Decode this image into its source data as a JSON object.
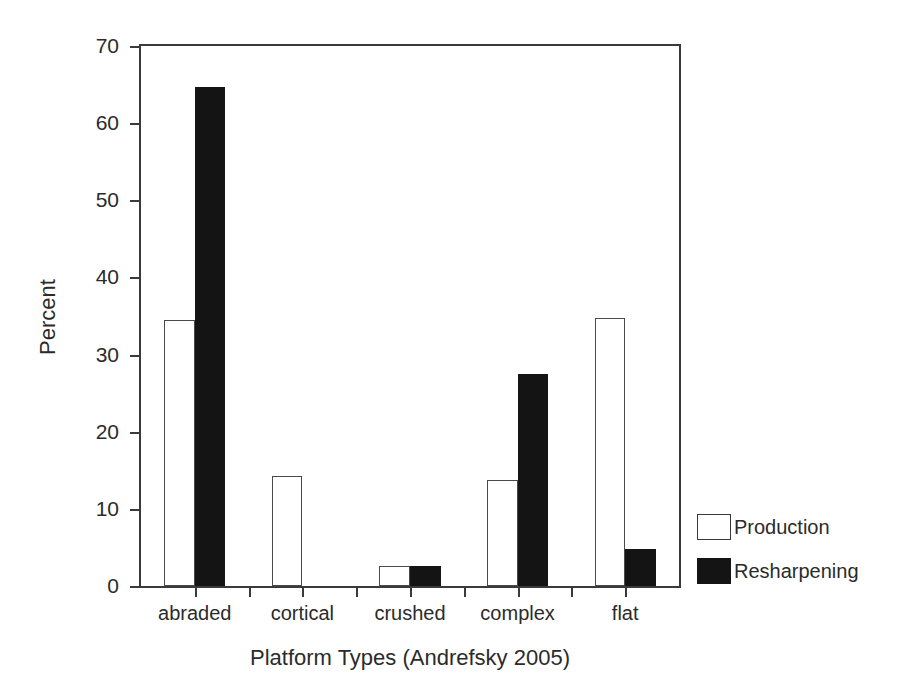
{
  "chart_data": {
    "type": "bar",
    "title": "",
    "xlabel": "Platform Types (Andrefsky 2005)",
    "ylabel": "Percent",
    "categories": [
      "abraded",
      "cortical",
      "crushed",
      "complex",
      "flat"
    ],
    "series": [
      {
        "name": "Production",
        "fill": "#ffffff",
        "edge": "#4a4a4a",
        "values": [
          34.5,
          14.3,
          2.6,
          13.7,
          34.7
        ]
      },
      {
        "name": "Resharpening",
        "fill": "#141414",
        "edge": "#141414",
        "values": [
          64.7,
          0,
          2.6,
          27.5,
          4.8
        ]
      }
    ],
    "ylim": [
      0,
      70
    ],
    "yticks": [
      0,
      10,
      20,
      30,
      40,
      50,
      60,
      70
    ],
    "ytick_labels": [
      "0",
      "10",
      "20",
      "30",
      "40",
      "50",
      "60",
      "70"
    ],
    "grid": false,
    "legend_position": "right-lower",
    "frame": "box",
    "background": "#ffffff",
    "axis_color": "#3a3a3a"
  },
  "axes": {
    "y_title": "Percent",
    "x_title": "Platform Types (Andrefsky 2005)"
  },
  "legend": {
    "entries": [
      {
        "label": "Production",
        "swatch": "open-square-icon"
      },
      {
        "label": "Resharpening",
        "swatch": "filled-square-icon"
      }
    ]
  }
}
